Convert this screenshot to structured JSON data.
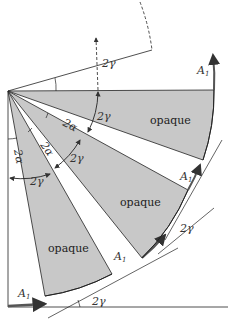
{
  "diagram": {
    "labels": {
      "opaque_1": "opaque",
      "opaque_2": "opaque",
      "opaque_3": "opaque",
      "gamma_top": "2γ",
      "gamma_arc1": "2γ",
      "gamma_arc2": "2γ",
      "gamma_arc3": "2γ",
      "gamma_tangent": "2γ",
      "gamma_bottom": "2γ",
      "alpha_1": "2α",
      "alpha_2": "2α",
      "alpha_3": "2α",
      "a1_top": "A",
      "a1_mid": "A",
      "a1_low": "A",
      "a1_bottom": "A",
      "subscript": "1"
    },
    "colors": {
      "opaque_fill": "#c8c8c8",
      "line": "#222222",
      "arrow": "#555555"
    }
  }
}
